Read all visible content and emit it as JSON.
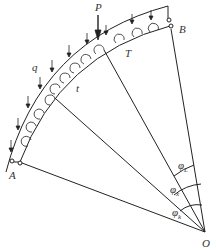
{
  "diagram": {
    "labels": {
      "P": "P",
      "q": "q",
      "T": "T",
      "t": "t",
      "A": "A",
      "B": "B",
      "O": "O",
      "phi_L": {
        "sym": "φ",
        "sub": "L"
      },
      "phi_x": {
        "sym": "φ",
        "sub": "x"
      },
      "phi_k": {
        "sym": "φ",
        "sub": "k"
      }
    },
    "colors": {
      "line": "#222222",
      "text": "#333333"
    }
  }
}
